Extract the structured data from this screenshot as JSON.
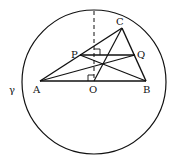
{
  "diagram": {
    "circle": {
      "label": "γ",
      "cx": 94,
      "cy": 82,
      "r": 72
    },
    "points": {
      "A": {
        "label": "A",
        "x": 40,
        "y": 81
      },
      "B": {
        "label": "B",
        "x": 146,
        "y": 81
      },
      "C": {
        "label": "C",
        "x": 122,
        "y": 28
      },
      "P": {
        "label": "P",
        "x": 80,
        "y": 55
      },
      "Q": {
        "label": "Q",
        "x": 135,
        "y": 55
      },
      "O": {
        "label": "O",
        "x": 94,
        "y": 81
      }
    },
    "colors": {
      "stroke": "#111111",
      "background": "#ffffff"
    }
  }
}
